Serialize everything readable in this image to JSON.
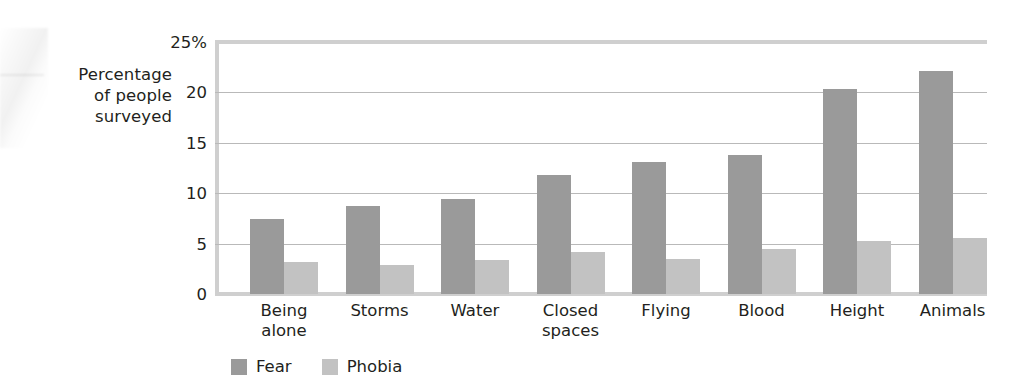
{
  "chart_data": {
    "type": "bar",
    "title": "",
    "subtitle": "",
    "xlabel": "",
    "ylabel": "Percentage of people surveyed",
    "ylabel_lines": [
      "Percentage",
      "of people",
      "surveyed"
    ],
    "categories": [
      "Being alone",
      "Storms",
      "Water",
      "Closed spaces",
      "Flying",
      "Blood",
      "Height",
      "Animals"
    ],
    "category_lines": [
      [
        "Being",
        "alone"
      ],
      [
        "Storms"
      ],
      [
        "Water"
      ],
      [
        "Closed",
        "spaces"
      ],
      [
        "Flying"
      ],
      [
        "Blood"
      ],
      [
        "Height"
      ],
      [
        "Animals"
      ]
    ],
    "series": [
      {
        "name": "Fear",
        "color": "#9a9a9a",
        "values": [
          7.4,
          8.7,
          9.4,
          11.8,
          13.1,
          13.8,
          20.3,
          22.1
        ]
      },
      {
        "name": "Phobia",
        "color": "#c2c2c2",
        "values": [
          3.2,
          2.9,
          3.4,
          4.2,
          3.5,
          4.5,
          5.3,
          5.6
        ]
      }
    ],
    "ylim": [
      0,
      25
    ],
    "yticks": [
      0,
      5,
      10,
      15,
      20,
      25
    ],
    "ytick_labels": [
      "0",
      "5",
      "10",
      "15",
      "20",
      "25%"
    ],
    "grid": true,
    "grid_axis": "y",
    "legend_position": "bottom-left"
  },
  "legend": {
    "items": [
      {
        "label": "Fear",
        "color": "#9a9a9a"
      },
      {
        "label": "Phobia",
        "color": "#c2c2c2"
      }
    ]
  },
  "colors": {
    "fear": "#9a9a9a",
    "phobia": "#c2c2c2",
    "gridline": "#b9b9b9",
    "axis": "#cfcfcf",
    "text": "#231f20",
    "background": "#ffffff"
  }
}
